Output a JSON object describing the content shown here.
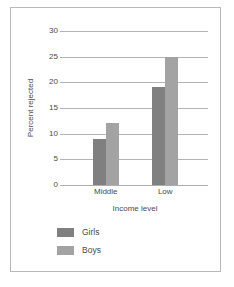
{
  "chart_data": {
    "type": "bar",
    "title": "",
    "subtitle": "",
    "xlabel": "Income level",
    "ylabel": "Percent rejected",
    "categories": [
      "Middle",
      "Low"
    ],
    "series": [
      {
        "name": "Girls",
        "values": [
          9,
          19
        ],
        "color": "#808080"
      },
      {
        "name": "Boys",
        "values": [
          12,
          25
        ],
        "color": "#a3a3a3"
      }
    ],
    "ylim": [
      0,
      30
    ],
    "yticks": [
      0,
      5,
      10,
      15,
      20,
      25,
      30
    ],
    "ytick_labels": [
      "0",
      "5",
      "10",
      "15",
      "20",
      "25",
      "30"
    ],
    "grid": true,
    "grid_color": "#b4b4b4",
    "legend_position": "bottom-left",
    "axis_color": "#adadad",
    "text_color": "#4a4a4a",
    "background": "#ffffff",
    "border_color": "#b9b9b9"
  }
}
